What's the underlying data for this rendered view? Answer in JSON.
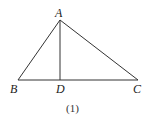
{
  "figure": {
    "points": {
      "A": {
        "label": "A",
        "x": 60,
        "y": 20
      },
      "B": {
        "label": "B",
        "x": 18,
        "y": 80
      },
      "C": {
        "label": "C",
        "x": 138,
        "y": 80
      },
      "D": {
        "label": "D",
        "x": 60,
        "y": 80
      }
    },
    "segments": [
      "AB",
      "AC",
      "BC",
      "AD"
    ],
    "caption": "(1)",
    "stroke_color": "#333333"
  }
}
